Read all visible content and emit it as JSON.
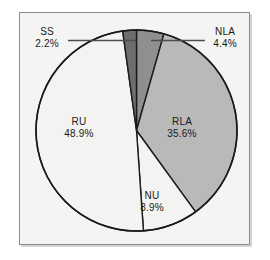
{
  "chart_data": {
    "type": "pie",
    "title": "",
    "subtitle": "",
    "xlabel": "",
    "ylabel": "",
    "legend_position": "none",
    "grid": false,
    "start_angle_deg": 0,
    "direction": "clockwise",
    "categories": [
      "NLA",
      "RLA",
      "NU",
      "RU",
      "SS"
    ],
    "values": [
      4.4,
      35.6,
      8.9,
      48.9,
      2.2
    ],
    "unit": "%",
    "slices": [
      {
        "name": "NLA",
        "value": 4.4,
        "label": "NLA",
        "value_label": "4.4%",
        "color": "#8f8f8f",
        "start_deg": 0,
        "end_deg": 15.84,
        "label_placement": "outside-right",
        "leader_line": true
      },
      {
        "name": "RLA",
        "value": 35.6,
        "label": "RLA",
        "value_label": "35.6%",
        "color": "#b9b9b9",
        "start_deg": 15.84,
        "end_deg": 143.99,
        "label_placement": "inside",
        "leader_line": false
      },
      {
        "name": "NU",
        "value": 8.9,
        "label": "NU",
        "value_label": "8.9%",
        "color": "#f3f3f1",
        "start_deg": 143.99,
        "end_deg": 176.03,
        "label_placement": "inside",
        "leader_line": false
      },
      {
        "name": "RU",
        "value": 48.9,
        "label": "RU",
        "value_label": "48.9%",
        "color": "#f3f3f1",
        "start_deg": 176.03,
        "end_deg": 352.07,
        "label_placement": "inside",
        "leader_line": false
      },
      {
        "name": "SS",
        "value": 2.2,
        "label": "SS",
        "value_label": "2.2%",
        "color": "#6e6e6e",
        "start_deg": 352.07,
        "end_deg": 360,
        "label_placement": "outside-left",
        "leader_line": true
      }
    ]
  },
  "figure": {
    "background_color": "#ffffff",
    "panel_color": "#f4f4f2",
    "panel_border_color": "#8d8d8d",
    "outline_color": "#1a1a1a",
    "text_color": "#1a1a1a",
    "leader_line_color": "#4d4d4d"
  },
  "labels": {
    "ss": {
      "name": "SS",
      "value": "2.2%"
    },
    "nla": {
      "name": "NLA",
      "value": "4.4%"
    },
    "ru": {
      "name": "RU",
      "value": "48.9%"
    },
    "rla": {
      "name": "RLA",
      "value": "35.6%"
    },
    "nu": {
      "name": "NU",
      "value": "8.9%"
    }
  }
}
